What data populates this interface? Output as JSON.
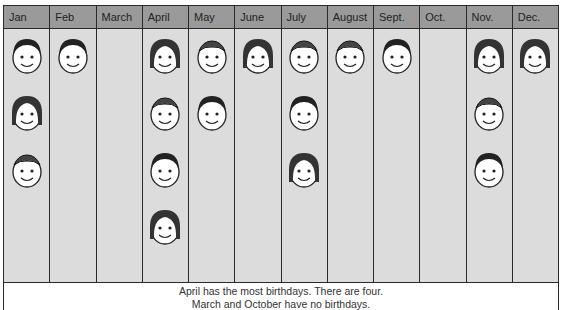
{
  "chart_data": {
    "type": "pictograph",
    "title": "",
    "categories": [
      "Jan",
      "Feb",
      "March",
      "April",
      "May",
      "June",
      "July",
      "August",
      "Sept.",
      "Oct.",
      "Nov.",
      "Dec."
    ],
    "values": [
      3,
      1,
      0,
      4,
      2,
      1,
      3,
      1,
      1,
      0,
      3,
      1
    ],
    "unit": "one face = one birthday",
    "xlabel": "",
    "ylabel": "",
    "grid": false,
    "annotations": [
      "April has the most birthdays. There are four.",
      "March and October have no birthdays."
    ]
  },
  "header": {
    "months": [
      "Jan",
      "Feb",
      "March",
      "April",
      "May",
      "June",
      "July",
      "August",
      "Sept.",
      "Oct.",
      "Nov.",
      "Dec."
    ]
  },
  "caption": {
    "line1": "April has the most birthdays. There are four.",
    "line2": "March and October have no birthdays."
  },
  "colors": {
    "header_bg": "#9a9a9a",
    "cell_bg": "#dcdcdc",
    "line": "#2a2a2a",
    "face": "#ffffff"
  }
}
